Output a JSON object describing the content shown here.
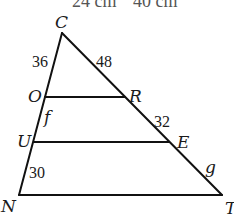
{
  "clipped_header": {
    "left": "24 cm",
    "right": "40 cm"
  },
  "diagram": {
    "type": "triangle with parallel segments",
    "vertices": {
      "C": "C",
      "N": "N",
      "T": "T"
    },
    "points": {
      "O": "O",
      "U": "U",
      "R": "R",
      "E": "E"
    },
    "segment_labels": {
      "CO": "36",
      "CR": "48",
      "OU": "f",
      "RE": "32",
      "UN": "30",
      "ET": "g"
    }
  }
}
